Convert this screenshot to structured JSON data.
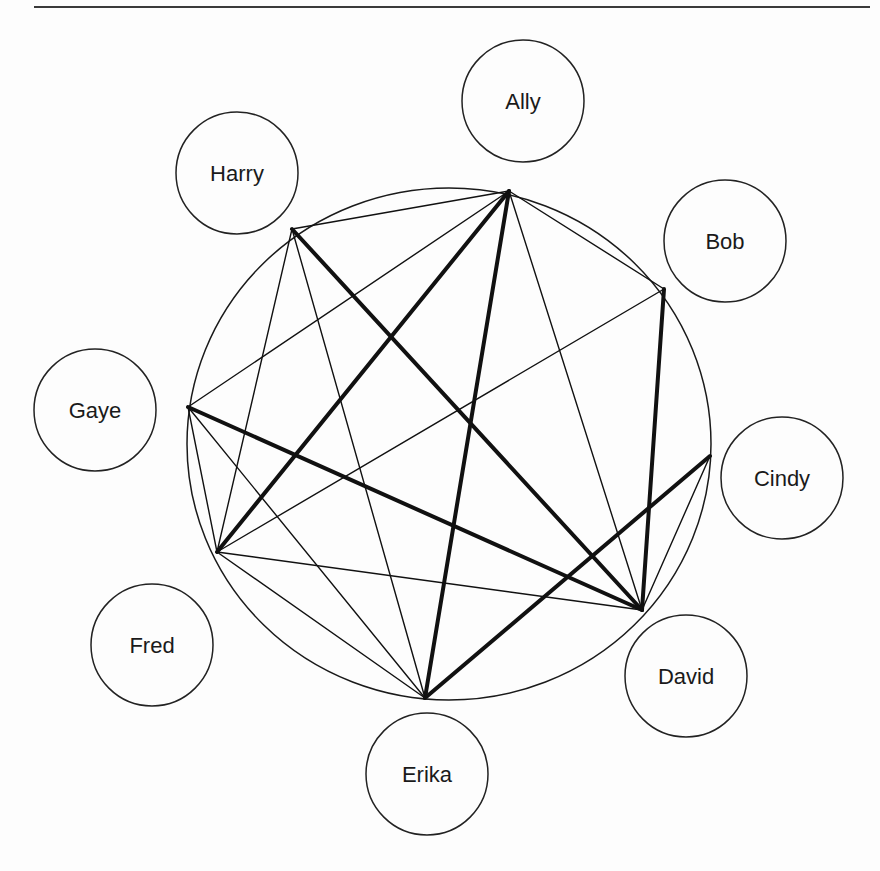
{
  "diagram": {
    "type": "graph",
    "separator": {
      "x1": 34,
      "x2": 870,
      "y": 7,
      "color": "#3a3a3a",
      "width": 2
    },
    "outer_circle": {
      "cx": 449,
      "cy": 444,
      "rx": 262,
      "ry": 256,
      "color": "#1a1a1a",
      "width": 1.5
    },
    "nodes": [
      {
        "id": "A",
        "label": "Ally",
        "vertex": [
          509,
          191
        ],
        "bubble": [
          523,
          101
        ],
        "r": 61
      },
      {
        "id": "B",
        "label": "Bob",
        "vertex": [
          664,
          289
        ],
        "bubble": [
          725,
          241
        ],
        "r": 61
      },
      {
        "id": "C",
        "label": "Cindy",
        "vertex": [
          710,
          456
        ],
        "bubble": [
          782,
          478
        ],
        "r": 61
      },
      {
        "id": "D",
        "label": "David",
        "vertex": [
          642,
          610
        ],
        "bubble": [
          686,
          676
        ],
        "r": 61
      },
      {
        "id": "E",
        "label": "Erika",
        "vertex": [
          425,
          698
        ],
        "bubble": [
          427,
          774
        ],
        "r": 61
      },
      {
        "id": "F",
        "label": "Fred",
        "vertex": [
          217,
          552
        ],
        "bubble": [
          152,
          645
        ],
        "r": 61
      },
      {
        "id": "G",
        "label": "Gaye",
        "vertex": [
          188,
          407
        ],
        "bubble": [
          95,
          410
        ],
        "r": 61
      },
      {
        "id": "H",
        "label": "Harry",
        "vertex": [
          292,
          229
        ],
        "bubble": [
          237,
          173
        ],
        "r": 61
      }
    ],
    "edges": [
      {
        "from": "H",
        "to": "D",
        "weight": "thick"
      },
      {
        "from": "A",
        "to": "F",
        "weight": "thick"
      },
      {
        "from": "A",
        "to": "E",
        "weight": "thick"
      },
      {
        "from": "B",
        "to": "D",
        "weight": "thick"
      },
      {
        "from": "G",
        "to": "D",
        "weight": "thick"
      },
      {
        "from": "C",
        "to": "E",
        "weight": "thick"
      },
      {
        "from": "H",
        "to": "A",
        "weight": "thin"
      },
      {
        "from": "H",
        "to": "F",
        "weight": "thin"
      },
      {
        "from": "H",
        "to": "E",
        "weight": "thin"
      },
      {
        "from": "A",
        "to": "B",
        "weight": "thin"
      },
      {
        "from": "A",
        "to": "G",
        "weight": "thin"
      },
      {
        "from": "A",
        "to": "D",
        "weight": "thin"
      },
      {
        "from": "B",
        "to": "F",
        "weight": "thin"
      },
      {
        "from": "C",
        "to": "D",
        "weight": "thin"
      },
      {
        "from": "G",
        "to": "F",
        "weight": "thin"
      },
      {
        "from": "G",
        "to": "E",
        "weight": "thin"
      },
      {
        "from": "F",
        "to": "D",
        "weight": "thin"
      },
      {
        "from": "F",
        "to": "E",
        "weight": "thin"
      }
    ],
    "stroke": {
      "thin": 1.4,
      "thick": 4,
      "color": "#111111",
      "bubble_color": "#222222"
    }
  }
}
